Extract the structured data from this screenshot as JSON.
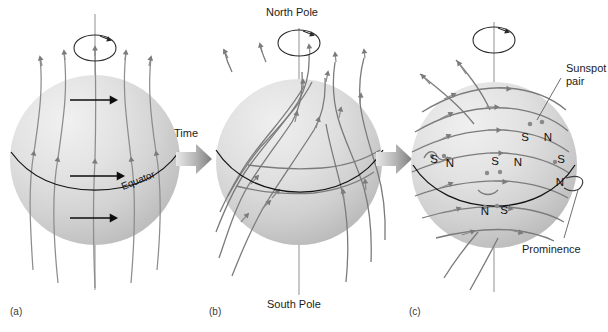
{
  "figure": {
    "background_color": "#ffffff",
    "width": 608,
    "height": 332,
    "sphere_color_light": "#ededed",
    "sphere_color_mid": "#d8d8d8",
    "sphere_color_dark": "#b9b9b9",
    "fieldline_color": "#8d8d8d",
    "equator_color": "#121212",
    "axis_color": "#9a9a9a"
  },
  "transitions": [
    {
      "label": "Time",
      "arrow": "right-arrow",
      "has_label": true
    },
    {
      "label": "",
      "arrow": "right-arrow",
      "has_label": false
    }
  ],
  "panels": [
    {
      "id": "a",
      "caption": "(a)",
      "description": "Sun with meridional (north-south) magnetic field lines and differential rotation",
      "labels": {
        "equator": "Equator"
      },
      "rotation_icon": "rotation-arrow",
      "differential_rotation_arrows": 2,
      "field_line_count": 5
    },
    {
      "id": "b",
      "caption": "(b)",
      "description": "Field lines wrapped around the Sun by differential rotation",
      "labels": {
        "north_pole": "North Pole",
        "south_pole": "South Pole"
      },
      "rotation_icon": "rotation-arrow",
      "field_line_count": 8
    },
    {
      "id": "c",
      "caption": "(c)",
      "description": "Tightly wound field lines erupt through the surface forming sunspot pairs and a prominence",
      "labels": {
        "sunspot_pair": "Sunspot\npair",
        "sunspot_pair_line1": "Sunspot",
        "sunspot_pair_line2": "pair",
        "prominence": "Prominence"
      },
      "rotation_icon": "rotation-arrow",
      "sunspot_pairs": [
        {
          "polarity_left": "S",
          "polarity_right": "N",
          "region": "upper-right"
        },
        {
          "polarity_left": "S",
          "polarity_right": "N",
          "region": "mid-left"
        },
        {
          "polarity_left": "S",
          "polarity_right": "N",
          "region": "mid-center"
        },
        {
          "polarity_left": "S",
          "polarity_right": "N",
          "region": "limb-right"
        },
        {
          "polarity_left": "N",
          "polarity_right": "S",
          "region": "lower-center"
        }
      ],
      "field_line_count": 9
    }
  ]
}
